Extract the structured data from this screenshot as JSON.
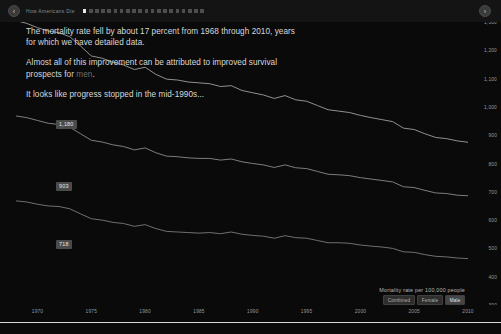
{
  "header": {
    "back_label": "‹",
    "forward_label": "›",
    "brand": "How Americans Die",
    "dot_count": 20,
    "active_dot": 0
  },
  "narrative": {
    "para1": "The mortality rate fell by about 17 percent from 1968 through 2010, years for which we have detailed data.",
    "para2_before": "Almost all of this improvement can be attributed to improved survival prospects for ",
    "para2_highlight": "men",
    "para2_after": ".",
    "para3": "It looks like progress stopped in the mid-1990s..."
  },
  "legend": {
    "title": "Mortality rate per 100,000 people",
    "buttons": [
      {
        "label": "Combined",
        "active": false
      },
      {
        "label": "Female",
        "active": false
      },
      {
        "label": "Male",
        "active": true
      }
    ]
  },
  "line_labels": {
    "male": "1,180",
    "combined": "903",
    "female": "718"
  },
  "colors": {
    "background": "#0a0a0a",
    "header": "#141414",
    "text": "#d8d8d8",
    "muted": "#6d6d6d",
    "axis": "#9a9a9a",
    "line_male": "#9e9e9e",
    "line_combined": "#8a8a8a",
    "line_female": "#7a7a7a",
    "baseline": "#d9d9d9",
    "chip": "#4b4b4b"
  },
  "chart_data": {
    "type": "line",
    "title": "Mortality rate per 100,000 people",
    "xlabel": "",
    "ylabel": "Mortality rate per 100,000 people",
    "xlim": [
      1968,
      2010
    ],
    "ylim": [
      300,
      1300
    ],
    "grid": false,
    "legend_position": "bottom-right",
    "x_ticks": [
      1970,
      1975,
      1980,
      1985,
      1990,
      1995,
      2000,
      2005,
      2010
    ],
    "y_ticks": [
      300,
      400,
      500,
      600,
      700,
      800,
      900,
      1000,
      1100,
      1200,
      1300
    ],
    "x": [
      1968,
      1969,
      1970,
      1971,
      1972,
      1973,
      1974,
      1975,
      1976,
      1977,
      1978,
      1979,
      1980,
      1981,
      1982,
      1983,
      1984,
      1985,
      1986,
      1987,
      1988,
      1989,
      1990,
      1991,
      1992,
      1993,
      1994,
      1995,
      1996,
      1997,
      1998,
      1999,
      2000,
      2001,
      2002,
      2003,
      2004,
      2005,
      2006,
      2007,
      2008,
      2009,
      2010
    ],
    "series": [
      {
        "name": "Male",
        "color": "#9e9e9e",
        "end_label": "1,180",
        "values": [
          1305,
          1295,
          1280,
          1268,
          1262,
          1248,
          1215,
          1180,
          1172,
          1158,
          1148,
          1132,
          1140,
          1115,
          1098,
          1095,
          1088,
          1085,
          1082,
          1072,
          1075,
          1058,
          1050,
          1042,
          1030,
          1040,
          1025,
          1020,
          1005,
          990,
          985,
          980,
          970,
          962,
          955,
          948,
          925,
          920,
          905,
          892,
          888,
          880,
          875
        ]
      },
      {
        "name": "Combined",
        "color": "#8a8a8a",
        "end_label": "903",
        "values": [
          968,
          962,
          952,
          942,
          938,
          928,
          905,
          882,
          876,
          866,
          860,
          848,
          855,
          838,
          826,
          824,
          820,
          818,
          818,
          812,
          816,
          806,
          800,
          795,
          786,
          795,
          785,
          782,
          772,
          762,
          760,
          757,
          750,
          745,
          740,
          735,
          718,
          715,
          705,
          696,
          694,
          688,
          686
        ]
      },
      {
        "name": "Female",
        "color": "#7a7a7a",
        "end_label": "718",
        "values": [
          668,
          664,
          656,
          650,
          648,
          640,
          622,
          605,
          600,
          592,
          588,
          578,
          584,
          570,
          560,
          558,
          556,
          554,
          556,
          552,
          558,
          550,
          546,
          543,
          536,
          545,
          538,
          536,
          528,
          520,
          520,
          518,
          512,
          508,
          505,
          500,
          488,
          486,
          478,
          472,
          470,
          466,
          464
        ]
      }
    ],
    "annotations": [
      {
        "text": "1,180",
        "series": "Male",
        "x": 1969
      },
      {
        "text": "903",
        "series": "Combined",
        "x": 1969
      },
      {
        "text": "718",
        "series": "Female",
        "x": 1969
      }
    ]
  }
}
